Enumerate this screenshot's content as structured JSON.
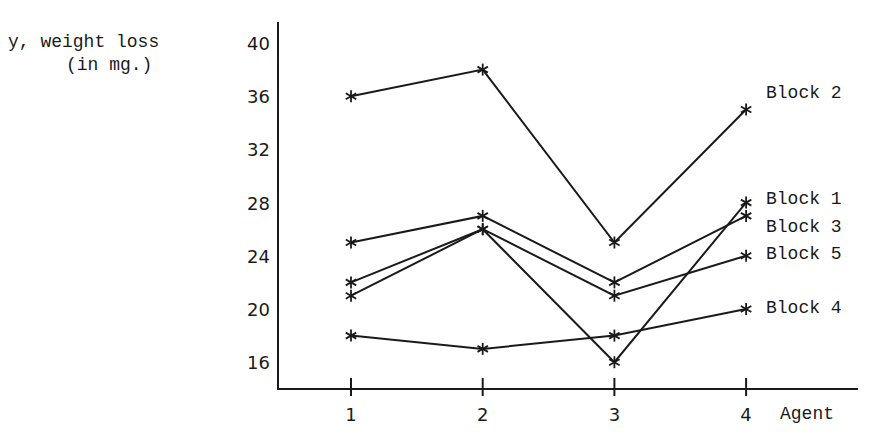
{
  "chart_data": {
    "type": "line",
    "title": "",
    "xlabel": "Agent",
    "ylabel": "y, weight loss (in mg.)",
    "ylabel_lines": [
      "y, weight loss",
      "(in mg.)"
    ],
    "x": [
      1,
      2,
      3,
      4
    ],
    "x_tick_labels": [
      "1",
      "2",
      "3",
      "4"
    ],
    "y_tick_labels": [
      "40",
      "36",
      "32",
      "28",
      "24",
      "20",
      "16"
    ],
    "y_ticks": [
      40,
      36,
      32,
      28,
      24,
      20,
      16
    ],
    "ylim": [
      14,
      42
    ],
    "grid": false,
    "marker": "asterisk",
    "legend_position": "inline-right",
    "series": [
      {
        "name": "Block 1",
        "values": [
          22,
          26,
          16,
          28
        ]
      },
      {
        "name": "Block 2",
        "values": [
          36,
          38,
          25,
          35
        ]
      },
      {
        "name": "Block 3",
        "values": [
          25,
          27,
          22,
          27
        ]
      },
      {
        "name": "Block 4",
        "values": [
          18,
          17,
          18,
          20
        ]
      },
      {
        "name": "Block 5",
        "values": [
          21,
          26,
          21,
          24
        ]
      }
    ],
    "series_label_y": {
      "Block 2": 93,
      "Block 1": 199,
      "Block 3": 227,
      "Block 5": 254,
      "Block 4": 308
    }
  }
}
